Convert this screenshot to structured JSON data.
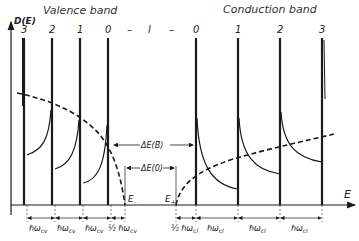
{
  "colors": {
    "ink": "#1a1a1a",
    "background": "#ffffff"
  },
  "titles": {
    "valence": "Valence band",
    "conduction": "Conduction band"
  },
  "axes": {
    "y_label": "D(E)",
    "x_label": "E"
  },
  "landau_index_labels": {
    "valence": [
      "3",
      "2",
      "1",
      "0"
    ],
    "middle": [
      "–",
      "l",
      "–"
    ],
    "conduction": [
      "0",
      "1",
      "2",
      "3"
    ]
  },
  "energy_labels": {
    "e_minus": "E",
    "e_minus_sub": "–",
    "e_plus": "E",
    "e_plus_sub": "+"
  },
  "gap_labels": {
    "delta_b": "ΔE(B⃗)",
    "delta_0": "ΔE(0)"
  },
  "spacing_labels": {
    "valence": [
      "ℏω",
      "ℏω",
      "ℏω",
      "½ ℏω"
    ],
    "valence_sub": "cv",
    "conduction": [
      "½ ℏω",
      "ℏω",
      "ℏω",
      "ℏω"
    ],
    "conduction_sub": "cl"
  },
  "curves": {
    "valence_dashed": "zero-field density of states (valence, dashed)",
    "conduction_dashed": "zero-field density of states (conduction, dashed)"
  }
}
